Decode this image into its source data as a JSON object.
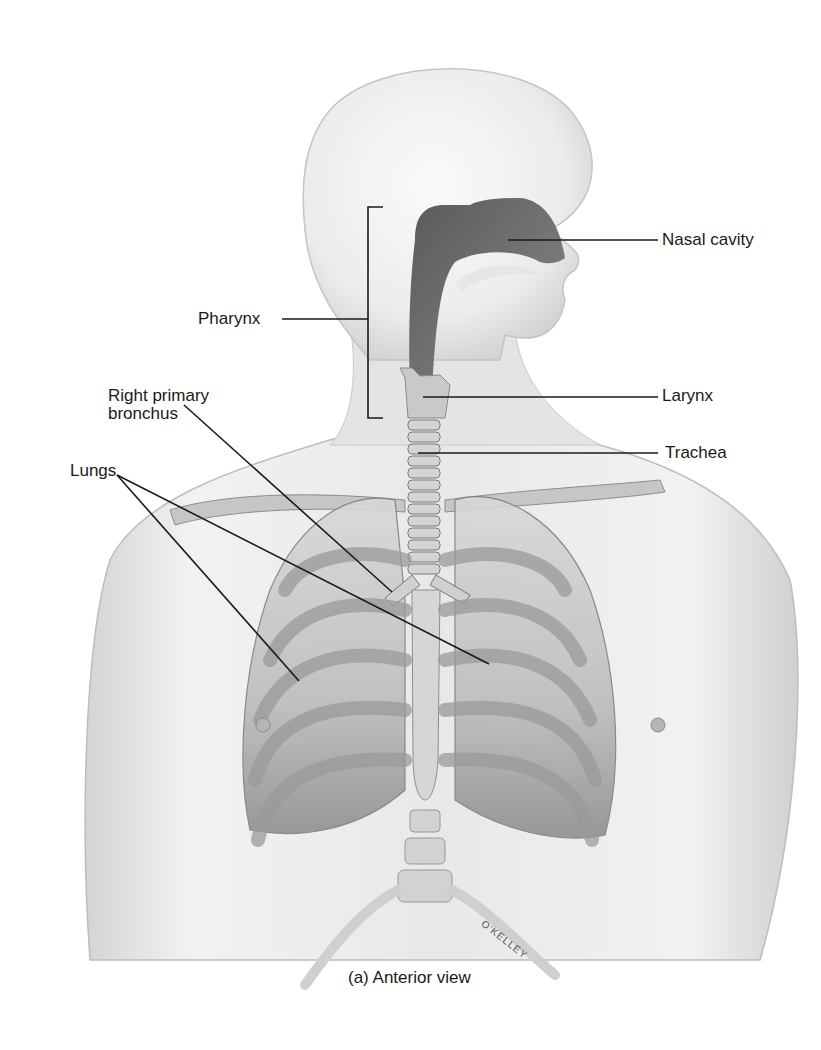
{
  "figure": {
    "type": "anatomical-illustration",
    "caption": "(a) Anterior view",
    "signature": "O'KELLEY"
  },
  "labels": {
    "nasal_cavity": "Nasal cavity",
    "pharynx": "Pharynx",
    "larynx": "Larynx",
    "trachea": "Trachea",
    "right_primary_bronchus_line1": "Right primary",
    "right_primary_bronchus_line2": "bronchus",
    "lungs": "Lungs"
  },
  "colors": {
    "background": "#ffffff",
    "skin_light": "#e6e6e6",
    "skin_mid": "#cfcfcf",
    "bone": "#bdbdbd",
    "airway_dark": "#6f6f6f",
    "leader_line": "#1a1a1a"
  }
}
